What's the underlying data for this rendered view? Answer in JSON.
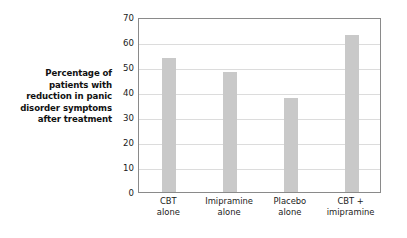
{
  "chart_data": {
    "type": "bar",
    "title": "",
    "subtitle": "",
    "xlabel": "",
    "ylabel": "Percentage of patients with reduction in panic disorder symptoms after treatment",
    "ylabel_lines": [
      "Percentage of",
      "patients with",
      "reduction in panic",
      "disorder symptoms",
      "after treatment"
    ],
    "categories": [
      "CBT alone",
      "Imipramine alone",
      "Placebo alone",
      "CBT + imipramine"
    ],
    "category_lines": [
      [
        "CBT",
        "alone"
      ],
      [
        "Imipramine",
        "alone"
      ],
      [
        "Placebo",
        "alone"
      ],
      [
        "CBT +",
        "imipramine"
      ]
    ],
    "values": [
      53.5,
      48,
      37.5,
      63
    ],
    "ylim": [
      0,
      70
    ],
    "ytick_values": [
      70,
      60,
      50,
      40,
      30,
      20,
      10,
      0
    ],
    "ytick_labels": [
      "70",
      "60",
      "50",
      "40",
      "30",
      "20",
      "10",
      "0"
    ],
    "grid": true,
    "grid_axis": "y",
    "legend": false,
    "legend_position": "none",
    "bar_color": "#c9c9c9",
    "grid_color": "#dcdcdc",
    "frame_color": "#8a8a8a",
    "text_color": "#1a1a1a"
  }
}
